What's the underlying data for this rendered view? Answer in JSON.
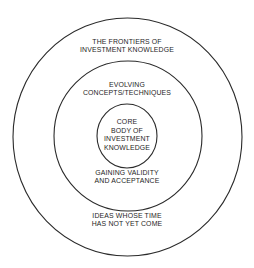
{
  "diagram": {
    "type": "concentric-circles",
    "stroke_color": "#2a2a2a",
    "text_color": "#1e1e1e",
    "background": "#ffffff",
    "rings": [
      {
        "id": "outer",
        "name": "The Frontiers of Investment Knowledge",
        "top_label": [
          "THE FRONTIERS OF",
          "INVESTMENT KNOWLEDGE"
        ],
        "bottom_label": [
          "IDEAS WHOSE TIME",
          "HAS NOT YET COME"
        ]
      },
      {
        "id": "middle",
        "name": "Evolving Concepts/Techniques",
        "top_label": [
          "EVOLVING",
          "CONCEPTS/TECHNIQUES"
        ],
        "bottom_label": [
          "GAINING VALIDITY",
          "AND ACCEPTANCE"
        ]
      },
      {
        "id": "inner",
        "name": "Core Body of Investment Knowledge",
        "center_label": [
          "CORE",
          "BODY OF",
          "INVESTMENT",
          "KNOWLEDGE"
        ]
      }
    ]
  }
}
